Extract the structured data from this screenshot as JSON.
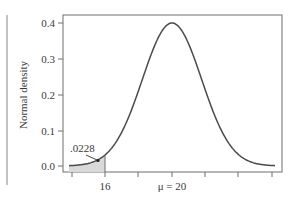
{
  "chart_data": {
    "type": "area",
    "title": "",
    "xlabel": "",
    "ylabel": "Normal density",
    "x_tick_labels": [
      "16",
      "μ = 20"
    ],
    "x_ticks": [
      14,
      16,
      18,
      20,
      22,
      24,
      26
    ],
    "y_ticks": [
      0.0,
      0.1,
      0.2,
      0.3,
      0.4
    ],
    "y_tick_labels": [
      "0.0",
      "0.1",
      "0.2",
      "0.3",
      "0.4"
    ],
    "ylim": [
      0,
      0.42
    ],
    "xlim": [
      13.5,
      26.5
    ],
    "series": [
      {
        "name": "Normal density curve",
        "mean": 20,
        "peak_density": 0.4,
        "x": [
          14,
          15,
          16,
          17,
          18,
          19,
          20,
          21,
          22,
          23,
          24,
          25,
          26
        ],
        "values": [
          0.004,
          0.013,
          0.03,
          0.09,
          0.2,
          0.33,
          0.4,
          0.33,
          0.2,
          0.09,
          0.03,
          0.013,
          0.004
        ]
      }
    ],
    "shaded_region": {
      "from": 14,
      "to": 16,
      "label": "Lower tail area"
    },
    "annotations": [
      {
        "text": ".0228",
        "points_to_x": 15.6
      }
    ],
    "grid": false,
    "legend": null
  },
  "labels": {
    "y_axis_title": "Normal density",
    "tail_area": ".0228",
    "x_tick_16": "16",
    "x_tick_mu": "μ = 20",
    "y_0": "0.0",
    "y_1": "0.1",
    "y_2": "0.2",
    "y_3": "0.3",
    "y_4": "0.4"
  },
  "colors": {
    "curve": "#4a4a4a",
    "shade": "#d9d9d9",
    "axis": "#6e6e6e"
  }
}
